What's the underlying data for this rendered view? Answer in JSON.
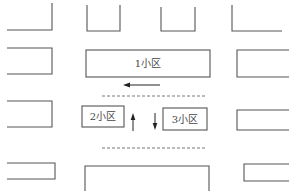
{
  "diagram": {
    "title": "",
    "labeled_blocks": [
      {
        "id": "block-1",
        "label": "1小区"
      },
      {
        "id": "block-2",
        "label": "2小区"
      },
      {
        "id": "block-3",
        "label": "3小区"
      }
    ],
    "arrows": [
      {
        "id": "arrow-left",
        "direction": "left"
      },
      {
        "id": "arrow-up",
        "direction": "up"
      },
      {
        "id": "arrow-down",
        "direction": "down"
      }
    ],
    "dashed_lines": 2,
    "unlabeled_blocks": 12,
    "colors": {
      "line": "#555555",
      "arrow": "#222222",
      "background": "#ffffff"
    }
  }
}
